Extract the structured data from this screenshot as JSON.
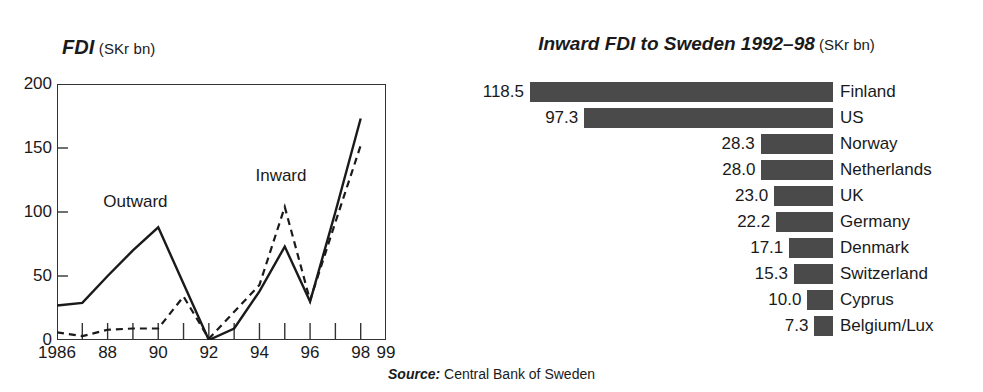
{
  "line_chart": {
    "title_main": "FDI",
    "title_unit": "(SKr bn)",
    "series_annotations": [
      {
        "name": "Outward",
        "label": "Outward"
      },
      {
        "name": "Inward",
        "label": "Inward"
      }
    ]
  },
  "bar_chart": {
    "title_main": "Inward FDI to Sweden 1992–98",
    "title_unit": "(SKr bn)"
  },
  "source": {
    "keyword": "Source:",
    "text": "Central Bank of Sweden"
  },
  "colors": {
    "bar_fill": "#4a4a4a",
    "axis": "#333333",
    "line": "#1a1a1a",
    "background": "#ffffff"
  },
  "chart_data": [
    {
      "type": "line",
      "title": "FDI (SKr bn)",
      "xlabel": "",
      "ylabel": "SKr bn",
      "ylim": [
        0,
        200
      ],
      "xlim": [
        1986,
        1999
      ],
      "yticks": [
        0,
        50,
        100,
        150,
        200
      ],
      "ytick_labels": [
        "0",
        "50",
        "100",
        "150",
        "200"
      ],
      "xticks": [
        1986,
        1987,
        1988,
        1989,
        1990,
        1991,
        1992,
        1993,
        1994,
        1995,
        1996,
        1997,
        1998,
        1999
      ],
      "xtick_labels": [
        "1986",
        "",
        "88",
        "",
        "90",
        "",
        "92",
        "",
        "94",
        "",
        "96",
        "",
        "98",
        "99"
      ],
      "grid": false,
      "legend_position": "inline-annotation",
      "x": [
        1986,
        1987,
        1988,
        1989,
        1990,
        1991,
        1992,
        1993,
        1994,
        1995,
        1996,
        1997,
        1998
      ],
      "series": [
        {
          "name": "Outward",
          "style": "solid",
          "values": [
            27,
            29,
            50,
            70,
            88,
            44,
            0,
            9,
            38,
            73,
            30,
            100,
            173
          ]
        },
        {
          "name": "Inward",
          "style": "dashed",
          "values": [
            6,
            3,
            8,
            9,
            9,
            34,
            1,
            22,
            43,
            104,
            31,
            92,
            152
          ]
        }
      ]
    },
    {
      "type": "bar",
      "orientation": "horizontal",
      "title": "Inward FDI to Sweden 1992–98 (SKr bn)",
      "xlabel": "SKr bn",
      "ylabel": "",
      "xlim": [
        0,
        118.5
      ],
      "grid": false,
      "legend_position": "none",
      "categories": [
        "Finland",
        "US",
        "Norway",
        "Netherlands",
        "UK",
        "Germany",
        "Denmark",
        "Switzerland",
        "Cyprus",
        "Belgium/Lux"
      ],
      "values": [
        118.5,
        97.3,
        28.3,
        28.0,
        23.0,
        22.2,
        17.1,
        15.3,
        10.0,
        7.3
      ],
      "value_labels": [
        "118.5",
        "97.3",
        "28.3",
        "28.0",
        "23.0",
        "22.2",
        "17.1",
        "15.3",
        "10.0",
        "7.3"
      ]
    }
  ]
}
